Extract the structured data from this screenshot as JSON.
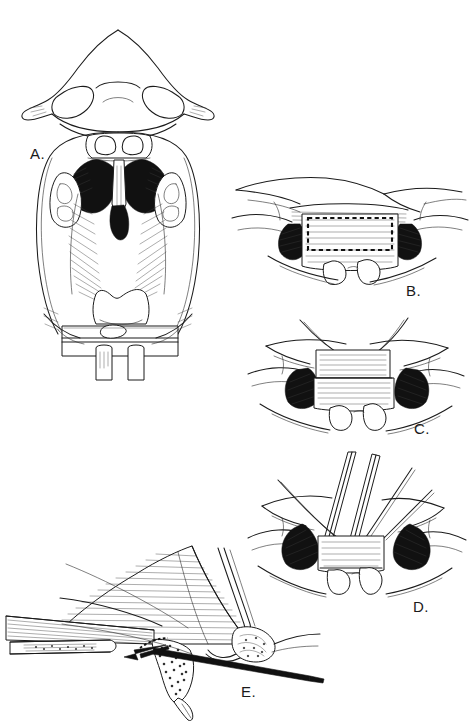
{
  "figure": {
    "kind": "surgical-technique-line-drawing",
    "medium": "pen-and-ink medical illustration",
    "background_color": "#ffffff",
    "ink_color": "#1b1b1b",
    "width": 472,
    "height": 728,
    "panel_count": 5
  },
  "panels": [
    {
      "id": "A",
      "label": "A.",
      "label_x": 30,
      "label_y": 146,
      "view": "transoral view of palate with nose above",
      "description": "Intraoral exposure showing the nose and nostrils superiorly, the alveolus with incisor teeth, a dark midline cleft of the palate, the tongue and uvula inferiorly, and a mouth gag retractor blade at the bottom.",
      "features": [
        "nose-with-nostrils",
        "upper-lip",
        "incisor-teeth",
        "cleft-palate-dark-defect",
        "vomer",
        "lateral-palatal-shelves",
        "tongue",
        "mouth-gag-blade"
      ]
    },
    {
      "id": "B",
      "label": "B.",
      "label_x": 406,
      "label_y": 283,
      "view": "close-up of cleft margin",
      "description": "Magnified view of the cleft defect with a dashed rectangular outline marking the planned mucoperiosteal flap incision; two teeth visible inferiorly.",
      "features": [
        "dashed-incision-outline",
        "flap-donor-site",
        "dark-cleft-space",
        "two-teeth",
        "lip-retraction"
      ]
    },
    {
      "id": "C",
      "label": "C.",
      "label_x": 414,
      "label_y": 421,
      "view": "flap elevated",
      "description": "The rectangular flap has been incised and elevated; traction sutures extend superiorly from the flap margins.",
      "features": [
        "elevated-rectangular-flap",
        "traction-sutures",
        "dark-cleft-space",
        "two-teeth"
      ]
    },
    {
      "id": "D",
      "label": "D.",
      "label_x": 413,
      "label_y": 599,
      "view": "instruments in field",
      "description": "Fine surgical instruments and suture needles converge on the elevated flap, which is being transposed into the cleft defect.",
      "features": [
        "surgical-instruments",
        "needle-holders",
        "suture-strands",
        "transposed-flap",
        "dark-cleft-space",
        "two-teeth"
      ]
    },
    {
      "id": "E",
      "label": "E.",
      "label_x": 241,
      "label_y": 684,
      "view": "sagittal cross-section",
      "description": "Sagittal section through the alveolus and palate. A heavy black osteotome/elevator is passed along the bone surface; a solid arrow indicates the direction of dissection, and a stippled bone-graft fragment is shown at the cleft.",
      "features": [
        "sagittal-tissue-section",
        "hatched-soft-tissue",
        "stippled-bone-graft",
        "black-osteotome",
        "direction-arrow",
        "nasal-floor-mucosa"
      ]
    }
  ],
  "annotations": {
    "arrow_direction": "leftward",
    "incision_marking_style": "dashed",
    "shading_style": "parallel line hatching and stipple"
  }
}
